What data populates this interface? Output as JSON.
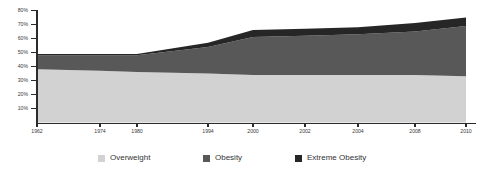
{
  "chart_data": {
    "type": "area",
    "title": "",
    "subtitle": "",
    "xlabel": "",
    "ylabel": "",
    "stacked": true,
    "grid": false,
    "legend_position": "bottom",
    "ylim": [
      0,
      80
    ],
    "xlim": [
      1962,
      2010
    ],
    "ytick_labels": [
      "80%",
      "70%",
      "60%",
      "50%",
      "40%",
      "30%",
      "20%",
      "10%"
    ],
    "ytick_values": [
      80,
      70,
      60,
      50,
      40,
      30,
      20,
      10
    ],
    "xtick_labels": [
      "1962",
      "1974",
      "1980",
      "1994",
      "2000",
      "2002",
      "2004",
      "2008",
      "2010"
    ],
    "xtick_values": [
      1962,
      1974,
      1980,
      1994,
      2000,
      2002,
      2004,
      2008,
      2010
    ],
    "x": [
      1962,
      1974,
      1980,
      1994,
      2000,
      2002,
      2004,
      2008,
      2010
    ],
    "series": [
      {
        "name": "Overweight",
        "color": "#d2d2d2",
        "values": [
          38,
          37,
          36,
          35,
          34,
          34,
          34,
          34,
          33
        ]
      },
      {
        "name": "Obesity",
        "color": "#585858",
        "values": [
          10,
          11,
          12,
          19,
          27,
          28,
          29,
          31,
          36
        ]
      },
      {
        "name": "Extreme Obesity",
        "color": "#262626",
        "values": [
          1,
          1,
          1,
          3,
          5,
          5,
          5,
          6,
          6
        ]
      }
    ],
    "totals": [
      49,
      49,
      49,
      57,
      66,
      67,
      68,
      71,
      75
    ]
  },
  "legend": {
    "items": [
      {
        "label": "Overweight",
        "color": "#d2d2d2"
      },
      {
        "label": "Obesity",
        "color": "#585858"
      },
      {
        "label": "Extreme Obesity",
        "color": "#262626"
      }
    ]
  },
  "colors": {
    "axis": "#2b2b2b",
    "tick_text": "#3a3a3a",
    "legend_text": "#333333",
    "background": "#ffffff"
  }
}
